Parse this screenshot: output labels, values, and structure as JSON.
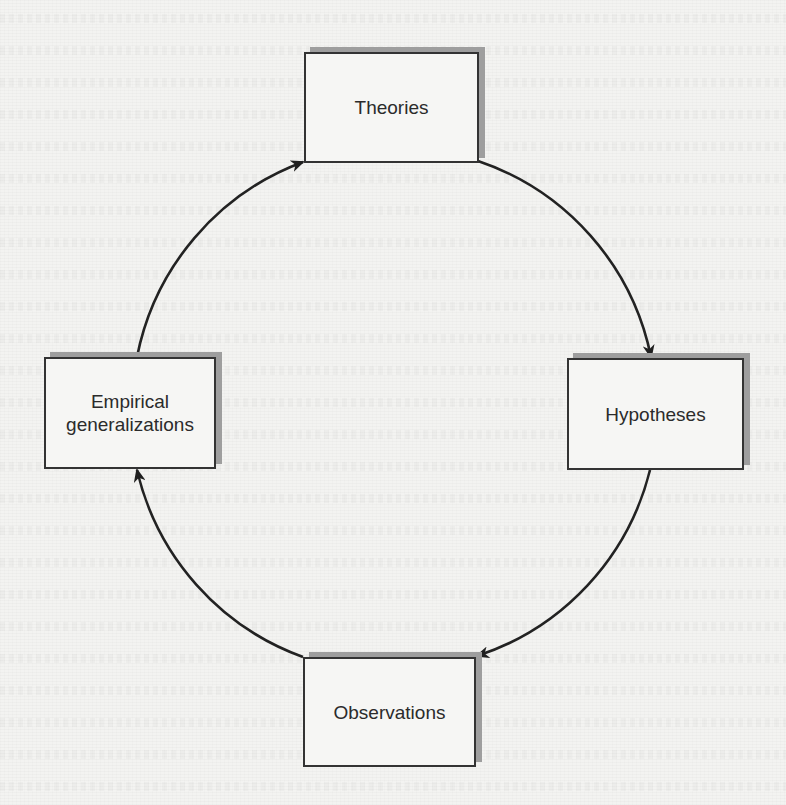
{
  "diagram": {
    "type": "cycle",
    "title": "",
    "background_color": "#f3f3f1",
    "line_color": "#222222",
    "box_border_color": "#333333",
    "box_shadow_color": "#9e9e9e",
    "nodes": [
      {
        "id": "theories",
        "label": "Theories",
        "position": "top"
      },
      {
        "id": "hypotheses",
        "label": "Hypotheses",
        "position": "right"
      },
      {
        "id": "observations",
        "label": "Observations",
        "position": "bottom"
      },
      {
        "id": "empirical",
        "label_line1": "Empirical",
        "label_line2": "generalizations",
        "label": "Empirical generalizations",
        "position": "left"
      }
    ],
    "edges": [
      {
        "from": "Theories",
        "to": "Hypotheses",
        "direction": "clockwise"
      },
      {
        "from": "Hypotheses",
        "to": "Observations",
        "direction": "clockwise"
      },
      {
        "from": "Observations",
        "to": "Empirical generalizations",
        "direction": "clockwise"
      },
      {
        "from": "Empirical generalizations",
        "to": "Theories",
        "direction": "clockwise"
      }
    ]
  }
}
